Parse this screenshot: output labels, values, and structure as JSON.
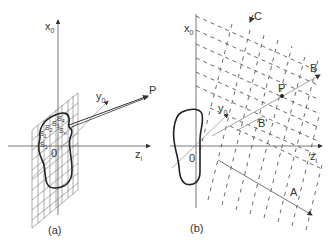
{
  "figure": {
    "panels": [
      {
        "id": "a",
        "caption": "(a)",
        "axes": {
          "vertical": "x0",
          "horizontal": "zi",
          "depth": "y0"
        },
        "origin_label": "0",
        "point_label": "P",
        "surface_elements": [
          "S1",
          "S2",
          "S3",
          "S4",
          "Sn",
          "S1"
        ]
      },
      {
        "id": "b",
        "caption": "(b)",
        "axes": {
          "vertical": "x0",
          "horizontal": "zi",
          "depth": "y0"
        },
        "origin_label": "0",
        "point_label": "P",
        "ray_labels": [
          "A",
          "B",
          "B'",
          "C"
        ]
      }
    ],
    "labels": {
      "a_x0": "x",
      "a_x0_sub": "0",
      "a_y0": "y",
      "a_y0_sub": "0",
      "a_zi": "z",
      "a_zi_sub": "i",
      "a_P": "P",
      "a_O": "0",
      "a_s1": "S",
      "a_s1_sub": "1",
      "a_s2": "S",
      "a_s2_sub": "2",
      "a_s3": "S",
      "a_s3_sub": "3",
      "a_s4": "S",
      "a_s4_sub": "4",
      "a_sn": "S",
      "a_sn_sub": "n",
      "a_sl": "S",
      "a_sl_sub": "1",
      "b_x0": "x",
      "b_x0_sub": "0",
      "b_y0": "y",
      "b_y0_sub": "0",
      "b_zi": "z",
      "b_zi_sub": "i",
      "b_P": "P",
      "b_O": "0",
      "b_A": "A",
      "b_B": "B",
      "b_Bp": "B'",
      "b_C": "C",
      "cap_a": "(a)",
      "cap_b": "(b)"
    },
    "colors": {
      "line": "#222222",
      "grid": "#666666",
      "axis": "#555555",
      "ray": "#999999"
    }
  }
}
